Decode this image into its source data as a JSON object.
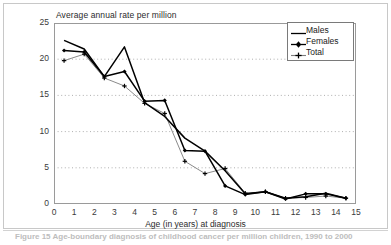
{
  "chart_data": {
    "type": "line",
    "title": "Average annual rate per million",
    "xlabel": "Age (in years) at diagnosis",
    "ylabel": "",
    "xlim": [
      0,
      15
    ],
    "ylim": [
      0,
      25
    ],
    "xticks": [
      "0",
      "1",
      "2",
      "3",
      "4",
      "5",
      "6",
      "7",
      "8",
      "9",
      "10",
      "11",
      "12",
      "13",
      "14",
      "15"
    ],
    "yticks": [
      "0",
      "5",
      "10",
      "15",
      "20",
      "25"
    ],
    "grid": "horizontal-dotted",
    "legend_position": "top-right",
    "x": [
      0.5,
      1.5,
      2.5,
      3.5,
      4.5,
      5.5,
      6.5,
      7.5,
      8.5,
      9.5,
      10.5,
      11.5,
      12.5,
      13.5,
      14.5
    ],
    "series": [
      {
        "name": "Males",
        "marker": "none",
        "color": "#000000",
        "values": [
          22.6,
          21.4,
          17.6,
          21.7,
          14.0,
          12.1,
          9.1,
          7.3,
          4.6,
          1.4,
          1.7,
          0.8,
          1.0,
          1.5,
          0.8
        ]
      },
      {
        "name": "Females",
        "marker": "diamond",
        "color": "#000000",
        "values": [
          21.2,
          21.0,
          17.6,
          18.3,
          14.2,
          14.3,
          7.4,
          7.3,
          2.5,
          1.3,
          1.7,
          0.7,
          1.4,
          1.4,
          0.8
        ]
      },
      {
        "name": "Total",
        "marker": "cross",
        "color": "#7d7d7d",
        "values": [
          19.8,
          20.7,
          17.4,
          16.3,
          13.9,
          12.5,
          5.9,
          4.2,
          4.9,
          1.5,
          1.7,
          0.8,
          0.9,
          1.1,
          0.8
        ]
      }
    ]
  },
  "legend": {
    "items": [
      {
        "label": "Males"
      },
      {
        "label": "Females"
      },
      {
        "label": "Total"
      }
    ]
  },
  "caption": {
    "text": "Figure 15  Age-boundary diagnosis of childhood cancer per million children, 1990 to 2000"
  }
}
